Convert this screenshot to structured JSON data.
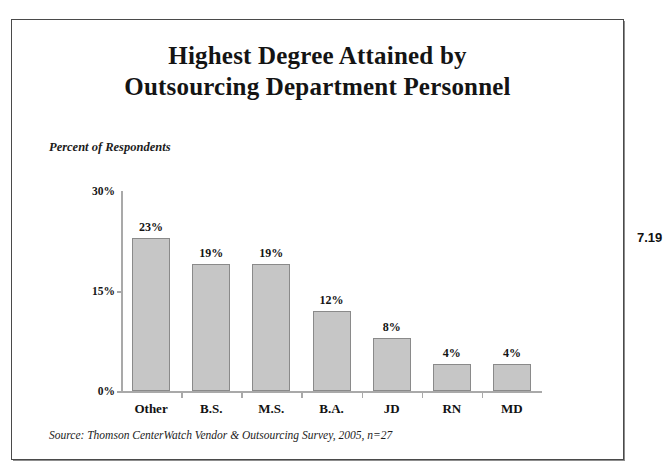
{
  "page_number": "7.19",
  "title": {
    "line1": "Highest Degree Attained by",
    "line2": "Outsourcing Department Personnel"
  },
  "axis_caption": "Percent of Respondents",
  "source_note": "Source: Thomson CenterWatch Vendor & Outsourcing Survey, 2005, n=27",
  "colors": {
    "bar_fill": "#c6c6c6",
    "bar_border": "#8a8a8a",
    "axis": "#a9a9a9",
    "frame": "#4a4a4a",
    "text": "#141414"
  },
  "chart_data": {
    "type": "bar",
    "title": "Highest Degree Attained by Outsourcing Department Personnel",
    "subtitle": "",
    "xlabel": "",
    "ylabel": "Percent of Respondents",
    "categories": [
      "Other",
      "B.S.",
      "M.S.",
      "B.A.",
      "JD",
      "RN",
      "MD"
    ],
    "values": [
      23,
      19,
      19,
      12,
      8,
      4,
      4
    ],
    "data_labels": [
      "23%",
      "19%",
      "19%",
      "12%",
      "8%",
      "4%",
      "4%"
    ],
    "ylim": [
      0,
      30
    ],
    "yticks": [
      0,
      15,
      30
    ],
    "ytick_labels": [
      "0%",
      "15%",
      "30%"
    ],
    "grid": false,
    "legend": null,
    "annotations": [
      "Source: Thomson CenterWatch Vendor & Outsourcing Survey, 2005, n=27"
    ]
  }
}
